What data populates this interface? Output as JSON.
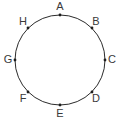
{
  "figure": {
    "background_color": "#ffffff",
    "stroke_color": "#2b2b2b",
    "dot_color": "#1d1d1d",
    "label_color": "#3a3a3a",
    "circle": {
      "center_x": 60,
      "center_y": 60,
      "radius": 45,
      "stroke_width": 1
    },
    "points": [
      {
        "label": "A",
        "angle_deg": 90,
        "dot_x": 60,
        "dot_y": 15,
        "label_x": 60,
        "label_y": 7
      },
      {
        "label": "B",
        "angle_deg": 45,
        "dot_x": 92,
        "dot_y": 28,
        "label_x": 96,
        "label_y": 22
      },
      {
        "label": "C",
        "angle_deg": 0,
        "dot_x": 105,
        "dot_y": 60,
        "label_x": 112,
        "label_y": 60
      },
      {
        "label": "D",
        "angle_deg": -45,
        "dot_x": 92,
        "dot_y": 92,
        "label_x": 96,
        "label_y": 99
      },
      {
        "label": "E",
        "angle_deg": -90,
        "dot_x": 60,
        "dot_y": 105,
        "label_x": 60,
        "label_y": 114
      },
      {
        "label": "F",
        "angle_deg": -135,
        "dot_x": 28,
        "dot_y": 92,
        "label_x": 23,
        "label_y": 99
      },
      {
        "label": "G",
        "angle_deg": 180,
        "dot_x": 15,
        "dot_y": 60,
        "label_x": 8,
        "label_y": 60
      },
      {
        "label": "H",
        "angle_deg": 135,
        "dot_x": 28,
        "dot_y": 28,
        "label_x": 23,
        "label_y": 22
      }
    ],
    "dot_radius": 1.4
  }
}
